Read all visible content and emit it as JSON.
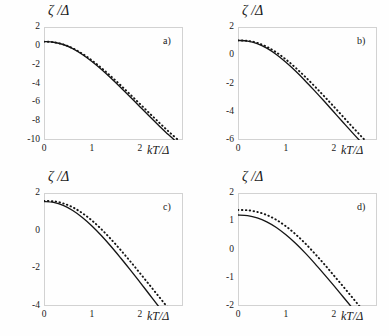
{
  "figure": {
    "panel_count": 4,
    "axis_labels": {
      "y": "ζ /Δ",
      "x": "kT/Δ"
    }
  },
  "chart_data": [
    {
      "type": "line",
      "panel": "a)",
      "title": "",
      "xlabel": "kT/Δ",
      "ylabel": "ζ /Δ",
      "xlim": [
        0,
        2.9
      ],
      "ylim": [
        -10,
        2
      ],
      "xticks": [
        "0",
        "1",
        "2"
      ],
      "xtick_values": [
        0,
        1,
        2
      ],
      "yticks": [
        "2",
        "0",
        "-2",
        "-4",
        "-6",
        "-8",
        "-10"
      ],
      "ytick_values": [
        2,
        0,
        -2,
        -4,
        -6,
        -8,
        -10
      ],
      "grid": false,
      "legend": "none",
      "series": [
        {
          "name": "solid",
          "style": "solid",
          "x": [
            0.0,
            0.2,
            0.4,
            0.6,
            0.8,
            1.0,
            1.2,
            1.4,
            1.6,
            1.8,
            2.0,
            2.2,
            2.4,
            2.6,
            2.8,
            2.9
          ],
          "values": [
            0.45,
            0.38,
            0.14,
            -0.3,
            -0.92,
            -1.67,
            -2.52,
            -3.45,
            -4.43,
            -5.44,
            -6.46,
            -7.48,
            -8.48,
            -9.45,
            -10.35,
            -10.78
          ]
        },
        {
          "name": "dotted",
          "style": "dotted",
          "x": [
            0.0,
            0.2,
            0.4,
            0.6,
            0.8,
            1.0,
            1.2,
            1.4,
            1.6,
            1.8,
            2.0,
            2.2,
            2.4,
            2.6,
            2.8,
            2.9
          ],
          "values": [
            0.45,
            0.38,
            0.15,
            -0.26,
            -0.84,
            -1.55,
            -2.36,
            -3.25,
            -4.19,
            -5.17,
            -6.16,
            -7.16,
            -8.14,
            -9.1,
            -10.0,
            -10.43
          ]
        }
      ]
    },
    {
      "type": "line",
      "panel": "b)",
      "title": "",
      "xlabel": "kT/Δ",
      "ylabel": "ζ /Δ",
      "xlim": [
        0,
        2.9
      ],
      "ylim": [
        -6,
        2
      ],
      "xticks": [
        "0",
        "1",
        "2"
      ],
      "xtick_values": [
        0,
        1,
        2
      ],
      "yticks": [
        "2",
        "0",
        "-2",
        "-4",
        "-6"
      ],
      "ytick_values": [
        2,
        0,
        -2,
        -4,
        -6
      ],
      "grid": false,
      "legend": "none",
      "series": [
        {
          "name": "solid",
          "style": "solid",
          "x": [
            0.0,
            0.2,
            0.4,
            0.6,
            0.8,
            1.0,
            1.2,
            1.4,
            1.6,
            1.8,
            2.0,
            2.2,
            2.4,
            2.6,
            2.8,
            2.9
          ],
          "values": [
            1.05,
            1.0,
            0.82,
            0.5,
            0.05,
            -0.5,
            -1.12,
            -1.8,
            -2.52,
            -3.26,
            -4.02,
            -4.78,
            -5.53,
            -6.26,
            -6.95,
            -7.28
          ]
        },
        {
          "name": "dotted",
          "style": "dotted",
          "x": [
            0.0,
            0.2,
            0.4,
            0.6,
            0.8,
            1.0,
            1.2,
            1.4,
            1.6,
            1.8,
            2.0,
            2.2,
            2.4,
            2.6,
            2.8,
            2.9
          ],
          "values": [
            1.05,
            1.02,
            0.88,
            0.6,
            0.2,
            -0.3,
            -0.88,
            -1.52,
            -2.2,
            -2.91,
            -3.64,
            -4.38,
            -5.12,
            -5.84,
            -6.53,
            -6.86
          ]
        }
      ]
    },
    {
      "type": "line",
      "panel": "c)",
      "title": "",
      "xlabel": "kT/Δ",
      "ylabel": "ζ /Δ",
      "xlim": [
        0,
        2.9
      ],
      "ylim": [
        -4,
        2
      ],
      "xticks": [
        "0",
        "1",
        "2"
      ],
      "xtick_values": [
        0,
        1,
        2
      ],
      "yticks": [
        "2",
        "0",
        "-2",
        "-4"
      ],
      "ytick_values": [
        2,
        0,
        -2,
        -4
      ],
      "grid": false,
      "legend": "none",
      "series": [
        {
          "name": "solid",
          "style": "solid",
          "x": [
            0.0,
            0.2,
            0.4,
            0.6,
            0.8,
            1.0,
            1.2,
            1.4,
            1.6,
            1.8,
            2.0,
            2.2,
            2.4,
            2.6,
            2.8,
            2.9
          ],
          "values": [
            1.55,
            1.5,
            1.34,
            1.07,
            0.7,
            0.25,
            -0.27,
            -0.84,
            -1.45,
            -2.08,
            -2.73,
            -3.39,
            -4.05,
            -4.7,
            -5.32,
            -5.62
          ]
        },
        {
          "name": "dotted",
          "style": "dotted",
          "x": [
            0.0,
            0.2,
            0.4,
            0.6,
            0.8,
            1.0,
            1.2,
            1.4,
            1.6,
            1.8,
            2.0,
            2.2,
            2.4,
            2.6,
            2.8,
            2.9
          ],
          "values": [
            1.58,
            1.56,
            1.45,
            1.24,
            0.93,
            0.54,
            0.07,
            -0.46,
            -1.03,
            -1.63,
            -2.25,
            -2.88,
            -3.51,
            -4.14,
            -4.75,
            -5.04
          ]
        }
      ]
    },
    {
      "type": "line",
      "panel": "d)",
      "title": "",
      "xlabel": "kT/Δ",
      "ylabel": "ζ /Δ",
      "xlim": [
        0,
        2.9
      ],
      "ylim": [
        -2,
        2
      ],
      "xticks": [
        "0",
        "1",
        "2"
      ],
      "xtick_values": [
        0,
        1,
        2
      ],
      "yticks": [
        "2",
        "1",
        "0",
        "-1",
        "-2"
      ],
      "ytick_values": [
        2,
        1,
        0,
        -1,
        -2
      ],
      "grid": false,
      "legend": "none",
      "series": [
        {
          "name": "solid",
          "style": "solid",
          "x": [
            0.0,
            0.2,
            0.4,
            0.6,
            0.8,
            1.0,
            1.2,
            1.4,
            1.6,
            1.8,
            2.0,
            2.2,
            2.4,
            2.6,
            2.8,
            2.9
          ],
          "values": [
            1.22,
            1.2,
            1.12,
            0.98,
            0.78,
            0.52,
            0.22,
            -0.12,
            -0.49,
            -0.88,
            -1.28,
            -1.69,
            -2.1,
            -2.51,
            -2.9,
            -3.09
          ]
        },
        {
          "name": "dotted",
          "style": "dotted",
          "x": [
            0.0,
            0.2,
            0.4,
            0.6,
            0.8,
            1.0,
            1.2,
            1.4,
            1.6,
            1.8,
            2.0,
            2.2,
            2.4,
            2.6,
            2.8,
            2.9
          ],
          "values": [
            1.4,
            1.39,
            1.33,
            1.22,
            1.05,
            0.82,
            0.54,
            0.22,
            -0.14,
            -0.52,
            -0.92,
            -1.32,
            -1.73,
            -2.14,
            -2.53,
            -2.72
          ]
        }
      ]
    }
  ],
  "panels": [
    {
      "label": "a)",
      "origin": {
        "x": 44,
        "y": 27
      }
    },
    {
      "label": "b)",
      "origin": {
        "x": 238,
        "y": 27
      }
    },
    {
      "label": "c)",
      "origin": {
        "x": 44,
        "y": 193
      }
    },
    {
      "label": "d)",
      "origin": {
        "x": 238,
        "y": 193
      }
    }
  ]
}
